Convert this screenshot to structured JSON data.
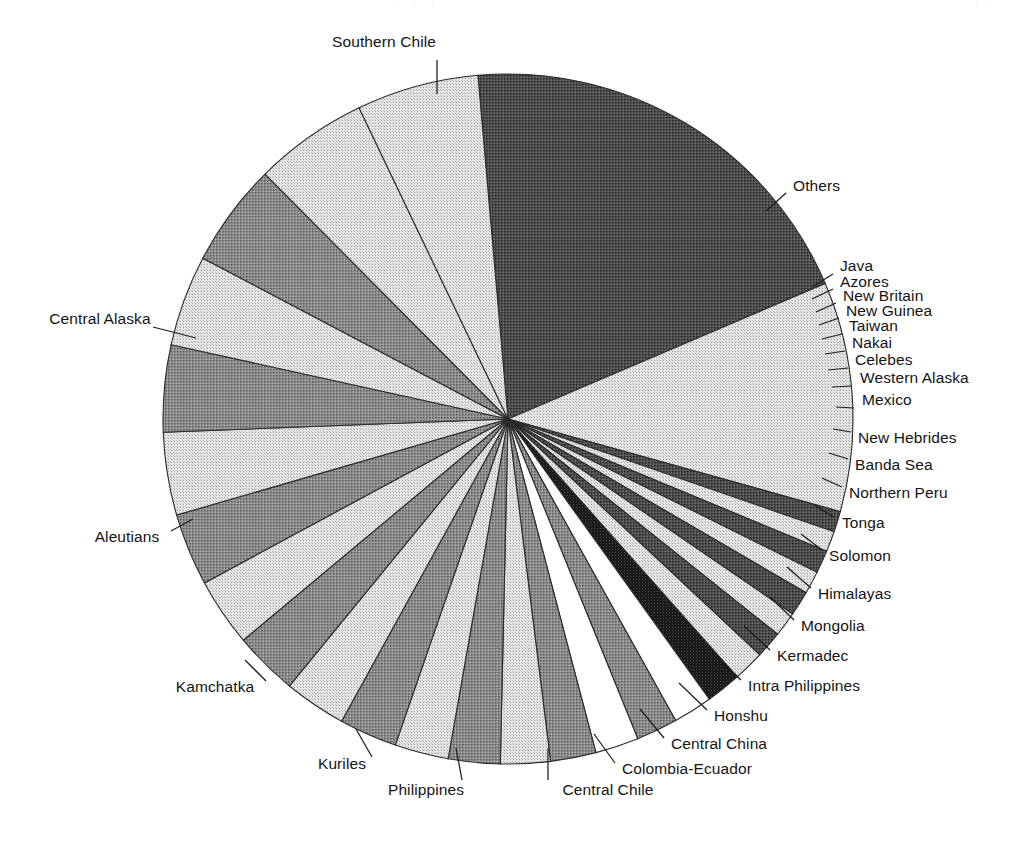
{
  "page": {
    "background_color": "#ffffff",
    "text_color": "#141414",
    "artifact_center": "· · ·",
    "artifact_right": "· ·"
  },
  "chart_data": {
    "type": "pie",
    "title": "",
    "subtitle": "",
    "xlabel": "",
    "ylabel": "",
    "legend_position": "callout-labels",
    "grid": false,
    "units": "share of total",
    "start_angle_deg": -5,
    "direction": "clockwise",
    "center_x": 508,
    "center_y": 419,
    "radius": 345,
    "categories": [
      "Southern Chile",
      "Others",
      "Java",
      "Azores",
      "New Britain",
      "New Guinea",
      "Taiwan",
      "Nakai",
      "Celebes",
      "Western Alaska",
      "Mexico",
      "New Hebrides",
      "Banda Sea",
      "Northern Peru",
      "Tonga",
      "Solomon",
      "Himalayas",
      "Mongolia",
      "Kermadec",
      "Intra Philippines",
      "Honshu",
      "Central China",
      "Colombia-Ecuador",
      "Central Chile",
      "Philippines",
      "Kuriles",
      "Kamchatka",
      "Aleutians",
      "Central Alaska"
    ],
    "values": [
      20.6,
      11.1,
      1.0,
      1.0,
      1.1,
      1.1,
      1.2,
      1.2,
      1.3,
      1.5,
      1.7,
      1.9,
      2.0,
      2.1,
      2.2,
      2.4,
      2.5,
      2.6,
      2.8,
      3.0,
      3.1,
      3.3,
      3.5,
      4.0,
      4.2,
      4.4,
      5.0,
      5.5,
      5.9
    ],
    "fills": [
      "dark",
      "light",
      "dark",
      "light",
      "dark",
      "light",
      "dark",
      "light",
      "dark",
      "light",
      "darkest",
      "white",
      "medium",
      "white",
      "medium",
      "light",
      "medium",
      "light",
      "medium",
      "light",
      "medium",
      "light",
      "medium",
      "light",
      "medium",
      "light",
      "medium",
      "light",
      "light"
    ]
  },
  "labels": [
    {
      "text": "Southern Chile",
      "align": "center",
      "x": 384,
      "y": 42
    },
    {
      "text": "Others",
      "align": "left",
      "x": 793,
      "y": 186
    },
    {
      "text": "Java",
      "align": "left",
      "x": 840,
      "y": 266
    },
    {
      "text": "Azores",
      "align": "left",
      "x": 840,
      "y": 282
    },
    {
      "text": "New Britain",
      "align": "left",
      "x": 843,
      "y": 296
    },
    {
      "text": "New Guinea",
      "align": "left",
      "x": 846,
      "y": 311
    },
    {
      "text": "Taiwan",
      "align": "left",
      "x": 849,
      "y": 326
    },
    {
      "text": "Nakai",
      "align": "left",
      "x": 852,
      "y": 343
    },
    {
      "text": "Celebes",
      "align": "left",
      "x": 855,
      "y": 360
    },
    {
      "text": "Western Alaska",
      "align": "left",
      "x": 860,
      "y": 378
    },
    {
      "text": "Mexico",
      "align": "left",
      "x": 862,
      "y": 400
    },
    {
      "text": "New Hebrides",
      "align": "left",
      "x": 858,
      "y": 438
    },
    {
      "text": "Banda Sea",
      "align": "left",
      "x": 855,
      "y": 465
    },
    {
      "text": "Northern Peru",
      "align": "left",
      "x": 849,
      "y": 493
    },
    {
      "text": "Tonga",
      "align": "left",
      "x": 842,
      "y": 523
    },
    {
      "text": "Solomon",
      "align": "left",
      "x": 829,
      "y": 556
    },
    {
      "text": "Himalayas",
      "align": "left",
      "x": 818,
      "y": 594
    },
    {
      "text": "Mongolia",
      "align": "left",
      "x": 801,
      "y": 626
    },
    {
      "text": "Kermadec",
      "align": "left",
      "x": 777,
      "y": 656
    },
    {
      "text": "Intra Philippines",
      "align": "left",
      "x": 748,
      "y": 686
    },
    {
      "text": "Honshu",
      "align": "left",
      "x": 714,
      "y": 716
    },
    {
      "text": "Central China",
      "align": "left",
      "x": 671,
      "y": 744
    },
    {
      "text": "Colombia-Ecuador",
      "align": "left",
      "x": 622,
      "y": 769
    },
    {
      "text": "Central Chile",
      "align": "center",
      "x": 608,
      "y": 790
    },
    {
      "text": "Philippines",
      "align": "center",
      "x": 426,
      "y": 790
    },
    {
      "text": "Kuriles",
      "align": "center",
      "x": 342,
      "y": 764
    },
    {
      "text": "Kamchatka",
      "align": "center",
      "x": 215,
      "y": 687
    },
    {
      "text": "Aleutians",
      "align": "center",
      "x": 127,
      "y": 537
    },
    {
      "text": "Central Alaska",
      "align": "center",
      "x": 100,
      "y": 319
    }
  ],
  "leaders": [
    {
      "name": "leader-southern-chile",
      "x1": 437,
      "y1": 60,
      "x2": 437,
      "y2": 94
    },
    {
      "name": "leader-others",
      "x1": 786,
      "y1": 193,
      "x2": 766,
      "y2": 211
    },
    {
      "name": "leader-java",
      "x1": 833,
      "y1": 274,
      "x2": 812,
      "y2": 287
    },
    {
      "name": "leader-azores",
      "x1": 833,
      "y1": 289,
      "x2": 812,
      "y2": 299
    },
    {
      "name": "leader-new-britain",
      "x1": 836,
      "y1": 303,
      "x2": 816,
      "y2": 312
    },
    {
      "name": "leader-new-guinea",
      "x1": 839,
      "y1": 318,
      "x2": 819,
      "y2": 325
    },
    {
      "name": "leader-taiwan",
      "x1": 842,
      "y1": 334,
      "x2": 822,
      "y2": 339
    },
    {
      "name": "leader-nakai",
      "x1": 845,
      "y1": 351,
      "x2": 825,
      "y2": 354
    },
    {
      "name": "leader-celebes",
      "x1": 848,
      "y1": 368,
      "x2": 828,
      "y2": 370
    },
    {
      "name": "leader-western-alaska",
      "x1": 852,
      "y1": 386,
      "x2": 832,
      "y2": 387
    },
    {
      "name": "leader-mexico",
      "x1": 854,
      "y1": 408,
      "x2": 836,
      "y2": 407
    },
    {
      "name": "leader-new-hebrides",
      "x1": 851,
      "y1": 432,
      "x2": 833,
      "y2": 429
    },
    {
      "name": "leader-banda-sea",
      "x1": 848,
      "y1": 459,
      "x2": 829,
      "y2": 453
    },
    {
      "name": "leader-northern-peru",
      "x1": 842,
      "y1": 487,
      "x2": 822,
      "y2": 478
    },
    {
      "name": "leader-tonga",
      "x1": 834,
      "y1": 517,
      "x2": 814,
      "y2": 505
    },
    {
      "name": "leader-solomon",
      "x1": 822,
      "y1": 550,
      "x2": 801,
      "y2": 534
    },
    {
      "name": "leader-himalayas",
      "x1": 811,
      "y1": 588,
      "x2": 787,
      "y2": 567
    },
    {
      "name": "leader-mongolia",
      "x1": 794,
      "y1": 620,
      "x2": 770,
      "y2": 597
    },
    {
      "name": "leader-kermadec",
      "x1": 770,
      "y1": 650,
      "x2": 744,
      "y2": 626
    },
    {
      "name": "leader-intra-philippines",
      "x1": 741,
      "y1": 680,
      "x2": 714,
      "y2": 654
    },
    {
      "name": "leader-honshu",
      "x1": 707,
      "y1": 710,
      "x2": 679,
      "y2": 683
    },
    {
      "name": "leader-central-china",
      "x1": 664,
      "y1": 738,
      "x2": 640,
      "y2": 709
    },
    {
      "name": "leader-colombia-ecuador",
      "x1": 615,
      "y1": 763,
      "x2": 594,
      "y2": 734
    },
    {
      "name": "leader-central-chile",
      "x1": 548,
      "y1": 780,
      "x2": 548,
      "y2": 748
    },
    {
      "name": "leader-philippines",
      "x1": 462,
      "y1": 780,
      "x2": 456,
      "y2": 748
    },
    {
      "name": "leader-kuriles",
      "x1": 372,
      "y1": 757,
      "x2": 356,
      "y2": 729
    },
    {
      "name": "leader-kamchatka",
      "x1": 266,
      "y1": 681,
      "x2": 245,
      "y2": 660
    },
    {
      "name": "leader-aleutians",
      "x1": 171,
      "y1": 531,
      "x2": 193,
      "y2": 519
    },
    {
      "name": "leader-central-alaska",
      "x1": 153,
      "y1": 327,
      "x2": 196,
      "y2": 338
    }
  ]
}
